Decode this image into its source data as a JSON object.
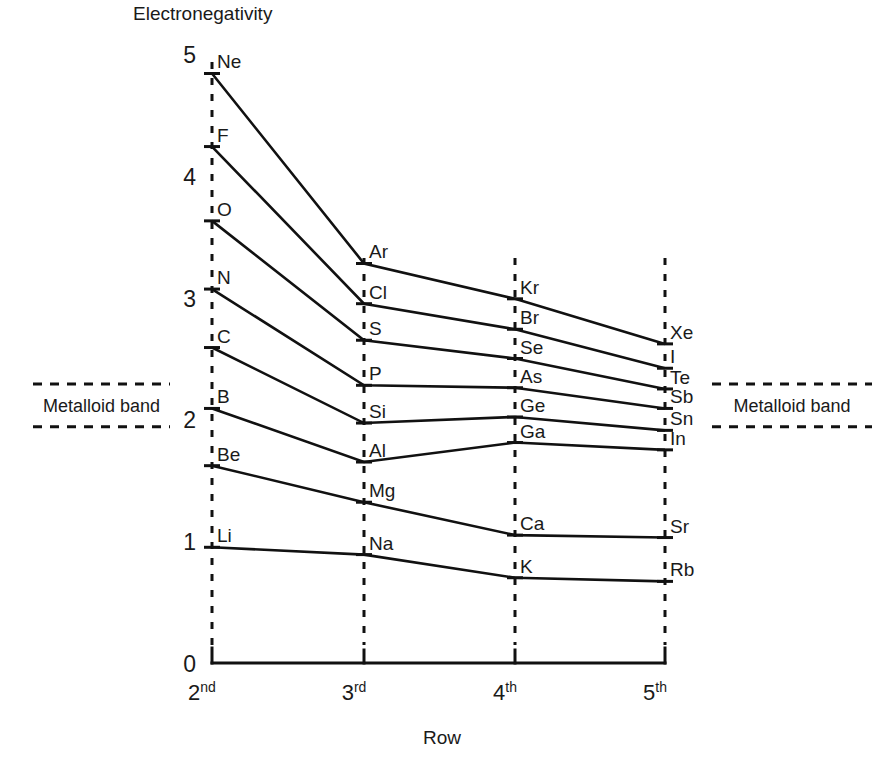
{
  "chart_data": {
    "type": "line",
    "title": "",
    "ylabel": "Electronegativity",
    "xlabel": "Row",
    "categories": [
      "2nd",
      "3rd",
      "4th",
      "5th"
    ],
    "category_parts": [
      {
        "base": "2",
        "sup": "nd"
      },
      {
        "base": "3",
        "sup": "rd"
      },
      {
        "base": "4",
        "sup": "th"
      },
      {
        "base": "5",
        "sup": "th"
      }
    ],
    "ylim": [
      0,
      5
    ],
    "yticks": [
      0,
      1,
      2,
      3,
      4,
      5
    ],
    "ytick_labels": [
      "0",
      "1",
      "2",
      "3",
      "4",
      "5"
    ],
    "grid": "vertical-dashed-at-categories",
    "legend": "none",
    "line_color": "#111111",
    "series": [
      {
        "name": "Group 18 (noble gases)",
        "labels": [
          "Ne",
          "Ar",
          "Kr",
          "Xe"
        ],
        "values": [
          4.84,
          3.28,
          2.99,
          2.62
        ]
      },
      {
        "name": "Group 17 (halogens)",
        "labels": [
          "F",
          "Cl",
          "Br",
          "I"
        ],
        "values": [
          4.24,
          2.95,
          2.74,
          2.42
        ]
      },
      {
        "name": "Group 16",
        "labels": [
          "O",
          "S",
          "Se",
          "Te"
        ],
        "values": [
          3.63,
          2.65,
          2.5,
          2.25
        ]
      },
      {
        "name": "Group 15",
        "labels": [
          "N",
          "P",
          "As",
          "Sb"
        ],
        "values": [
          3.07,
          2.28,
          2.26,
          2.09
        ]
      },
      {
        "name": "Group 14",
        "labels": [
          "C",
          "Si",
          "Ge",
          "Sn"
        ],
        "values": [
          2.59,
          1.97,
          2.02,
          1.91
        ]
      },
      {
        "name": "Group 13",
        "labels": [
          "B",
          "Al",
          "Ga",
          "In"
        ],
        "values": [
          2.09,
          1.65,
          1.81,
          1.75
        ]
      },
      {
        "name": "Group 2 (alkaline earth)",
        "labels": [
          "Be",
          "Mg",
          "Ca",
          "Sr"
        ],
        "values": [
          1.62,
          1.32,
          1.05,
          1.03
        ]
      },
      {
        "name": "Group 1 (alkali metals)",
        "labels": [
          "Li",
          "Na",
          "K",
          "Rb"
        ],
        "values": [
          0.95,
          0.89,
          0.7,
          0.67
        ]
      }
    ],
    "annotations": [
      {
        "id": "metalloid-band-left",
        "text": "Metalloid band",
        "side": "left",
        "upper": 2.29,
        "lower": 1.94
      },
      {
        "id": "metalloid-band-right",
        "text": "Metalloid band",
        "side": "right",
        "upper": 2.29,
        "lower": 1.94
      }
    ]
  }
}
